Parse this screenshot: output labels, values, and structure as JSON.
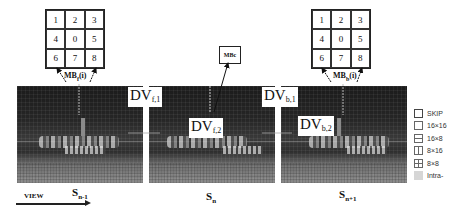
{
  "diagram": {
    "grids": [
      {
        "id": "left",
        "cells": [
          "1",
          "2",
          "3",
          "4",
          "0",
          "5",
          "6",
          "7",
          "8"
        ],
        "label_main": "MB",
        "label_sub": "f",
        "label_suffix": "(i)"
      },
      {
        "id": "right",
        "cells": [
          "1",
          "2",
          "3",
          "4",
          "0",
          "5",
          "6",
          "7",
          "8"
        ],
        "label_main": "MB",
        "label_sub": "b",
        "label_suffix": "(i)"
      }
    ],
    "center_block": {
      "label": "MBc"
    },
    "disparity_vectors": [
      {
        "main": "DV",
        "sub": "f,1"
      },
      {
        "main": "DV",
        "sub": "f,2"
      },
      {
        "main": "DV",
        "sub": "b,1"
      },
      {
        "main": "DV",
        "sub": "b,2"
      }
    ],
    "frames": [
      {
        "main": "S",
        "sub": "n-1"
      },
      {
        "main": "S",
        "sub": "n"
      },
      {
        "main": "S",
        "sub": "n+1"
      }
    ],
    "view": {
      "label": "VIEW"
    },
    "legend": [
      {
        "key": "skip",
        "label": "SKIP"
      },
      {
        "key": "16x16",
        "label": "16×16"
      },
      {
        "key": "16x8",
        "label": "16×8"
      },
      {
        "key": "8x16",
        "label": "8×16"
      },
      {
        "key": "8x8",
        "label": "8×8"
      },
      {
        "key": "intra",
        "label": "Intra-"
      }
    ]
  }
}
